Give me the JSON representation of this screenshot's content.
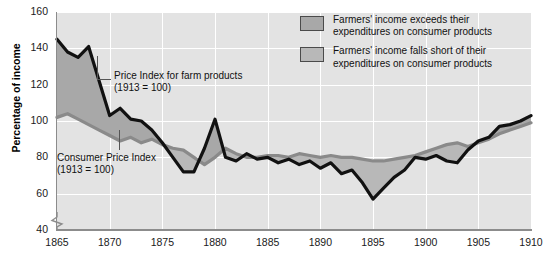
{
  "chart_data": {
    "type": "line",
    "title": "",
    "xlabel": "",
    "ylabel": "Percentage of income",
    "xlim": [
      1865,
      1910
    ],
    "ylim": [
      40,
      160
    ],
    "yticks": [
      40,
      60,
      80,
      100,
      120,
      140,
      160
    ],
    "xticks": [
      1865,
      1870,
      1875,
      1880,
      1885,
      1890,
      1895,
      1900,
      1905,
      1910
    ],
    "grid": true,
    "axis_break_below": 40,
    "legend_position": "top-right",
    "x": [
      1865,
      1866,
      1867,
      1868,
      1869,
      1870,
      1871,
      1872,
      1873,
      1874,
      1875,
      1876,
      1877,
      1878,
      1879,
      1880,
      1881,
      1882,
      1883,
      1884,
      1885,
      1886,
      1887,
      1888,
      1889,
      1890,
      1891,
      1892,
      1893,
      1894,
      1895,
      1896,
      1897,
      1898,
      1899,
      1900,
      1901,
      1902,
      1903,
      1904,
      1905,
      1906,
      1907,
      1908,
      1909,
      1910
    ],
    "series": [
      {
        "name": "Price Index for farm products (1913 = 100)",
        "color": "#111111",
        "values": [
          145,
          138,
          135,
          141,
          122,
          103,
          107,
          101,
          100,
          95,
          88,
          80,
          72,
          72,
          85,
          101,
          80,
          78,
          82,
          79,
          80,
          77,
          79,
          76,
          78,
          74,
          77,
          71,
          73,
          66,
          57,
          63,
          69,
          73,
          80,
          79,
          81,
          78,
          77,
          84,
          89,
          91,
          97,
          98,
          100,
          103
        ]
      },
      {
        "name": "Consumer Price Index (1913 = 100)",
        "color": "#8a8a8a",
        "values": [
          102,
          104,
          101,
          98,
          95,
          92,
          89,
          91,
          88,
          90,
          87,
          85,
          84,
          80,
          76,
          80,
          85,
          82,
          80,
          80,
          81,
          81,
          80,
          82,
          81,
          80,
          81,
          80,
          80,
          79,
          78,
          78,
          79,
          80,
          81,
          83,
          85,
          87,
          88,
          86,
          88,
          90,
          93,
          95,
          97,
          99
        ]
      }
    ],
    "bands": [
      {
        "name": "Farmers' income exceeds their expenditures on consumer products",
        "color": "#a8a8a8"
      },
      {
        "name": "Farmers' income falls short of their expenditures on consumer products",
        "color": "#b8b8b8"
      }
    ],
    "annotations": [
      {
        "id": "farm",
        "line1": "Price Index for farm products",
        "line2": "(1913 = 100)"
      },
      {
        "id": "cpi",
        "line1": "Consumer Price Index",
        "line2": "(1913 = 100)"
      }
    ]
  },
  "legend": {
    "items": [
      {
        "line1": "Farmers' income exceeds their",
        "line2": "expenditures on consumer products"
      },
      {
        "line1": "Farmers' income falls short of their",
        "line2": "expenditures on consumer products"
      }
    ]
  },
  "colors": {
    "plot_background": "#e3e3e3",
    "gridline": "#ffffff",
    "axis": "#8c8c8c",
    "band_above": "#a8a8a8",
    "band_below": "#b8b8b8",
    "farm_line": "#111111",
    "cpi_line": "#8a8a8a"
  }
}
